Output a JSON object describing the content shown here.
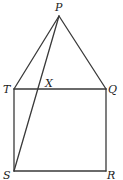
{
  "diagram": {
    "type": "geometry-figure",
    "points": {
      "P": {
        "label": "P",
        "x": 59,
        "y": 16
      },
      "T": {
        "label": "T",
        "x": 14,
        "y": 89
      },
      "Q": {
        "label": "Q",
        "x": 106,
        "y": 89
      },
      "S": {
        "label": "S",
        "x": 14,
        "y": 171
      },
      "R": {
        "label": "R",
        "x": 106,
        "y": 171
      },
      "X": {
        "label": "X",
        "x": 37,
        "y": 89
      }
    },
    "segments": [
      [
        "P",
        "T"
      ],
      [
        "P",
        "Q"
      ],
      [
        "P",
        "S"
      ],
      [
        "T",
        "Q"
      ],
      [
        "Q",
        "R"
      ],
      [
        "R",
        "S"
      ],
      [
        "S",
        "T"
      ]
    ],
    "colors": {
      "line": "#3a3a3a",
      "text": "#222222",
      "background": "#ffffff"
    }
  }
}
